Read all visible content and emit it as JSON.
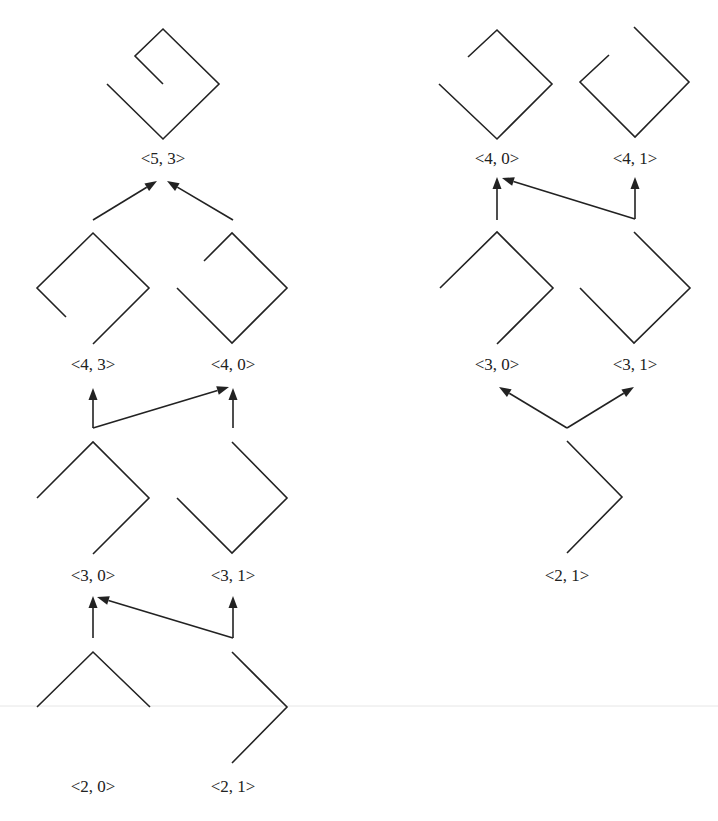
{
  "colors": {
    "stroke": "#222222",
    "background": "#ffffff"
  },
  "left_tree": {
    "nodes": [
      {
        "id": "L53",
        "label": "<5, 3>",
        "label_xy": [
          163,
          164
        ],
        "points": [
          [
            107,
            84
          ],
          [
            163,
            139
          ],
          [
            219,
            84
          ],
          [
            163,
            29
          ],
          [
            135,
            56
          ],
          [
            163,
            84
          ]
        ]
      },
      {
        "id": "L43",
        "label": "<4, 3>",
        "label_xy": [
          93,
          370
        ],
        "points": [
          [
            93,
            344
          ],
          [
            149,
            288
          ],
          [
            93,
            233
          ],
          [
            37,
            288
          ],
          [
            66,
            317
          ]
        ]
      },
      {
        "id": "L40",
        "label": "<4, 0>",
        "label_xy": [
          233,
          370
        ],
        "points": [
          [
            204,
            261
          ],
          [
            232,
            233
          ],
          [
            287,
            288
          ],
          [
            232,
            343
          ],
          [
            177,
            288
          ]
        ]
      },
      {
        "id": "L30",
        "label": "<3, 0>",
        "label_xy": [
          93,
          581
        ],
        "points": [
          [
            37,
            498
          ],
          [
            93,
            442
          ],
          [
            149,
            498
          ],
          [
            93,
            554
          ]
        ]
      },
      {
        "id": "L31",
        "label": "<3, 1>",
        "label_xy": [
          233,
          581
        ],
        "points": [
          [
            232,
            442
          ],
          [
            287,
            498
          ],
          [
            232,
            553
          ],
          [
            177,
            498
          ]
        ]
      },
      {
        "id": "L20",
        "label": "<2, 0>",
        "label_xy": [
          93,
          792
        ],
        "points": [
          [
            37,
            707
          ],
          [
            93,
            652
          ],
          [
            150,
            707
          ]
        ]
      },
      {
        "id": "L21",
        "label": "<2, 1>",
        "label_xy": [
          233,
          792
        ],
        "points": [
          [
            232,
            652
          ],
          [
            287,
            707
          ],
          [
            232,
            763
          ]
        ]
      }
    ],
    "edges": [
      {
        "from": "L43",
        "to": "L53",
        "points": [
          [
            93,
            220
          ],
          [
            157,
            181
          ]
        ]
      },
      {
        "from": "L40",
        "to": "L53",
        "points": [
          [
            233,
            220
          ],
          [
            167,
            181
          ]
        ]
      },
      {
        "from": "L30",
        "to": "L43",
        "points": [
          [
            93,
            428
          ],
          [
            93,
            388
          ]
        ]
      },
      {
        "from": "L30",
        "to": "L40",
        "points": [
          [
            93,
            428
          ],
          [
            229,
            387
          ]
        ]
      },
      {
        "from": "L31",
        "to": "L40",
        "points": [
          [
            233,
            428
          ],
          [
            233,
            388
          ]
        ]
      },
      {
        "from": "L20",
        "to": "L30",
        "points": [
          [
            93,
            638
          ],
          [
            93,
            596
          ]
        ]
      },
      {
        "from": "L21",
        "to": "L30",
        "points": [
          [
            233,
            638
          ],
          [
            97,
            597
          ]
        ]
      },
      {
        "from": "L21",
        "to": "L31",
        "points": [
          [
            233,
            638
          ],
          [
            233,
            596
          ]
        ]
      }
    ]
  },
  "right_tree": {
    "nodes": [
      {
        "id": "R40",
        "label": "<4, 0>",
        "label_xy": [
          497,
          164
        ],
        "points": [
          [
            468,
            57
          ],
          [
            497,
            30
          ],
          [
            552,
            84
          ],
          [
            497,
            139
          ],
          [
            439,
            84
          ]
        ]
      },
      {
        "id": "R41",
        "label": "<4, 1>",
        "label_xy": [
          635,
          164
        ],
        "points": [
          [
            609,
            55
          ],
          [
            580,
            82
          ],
          [
            635,
            137
          ],
          [
            689,
            82
          ],
          [
            634,
            27
          ]
        ]
      },
      {
        "id": "R30",
        "label": "<3, 0>",
        "label_xy": [
          497,
          370
        ],
        "points": [
          [
            440,
            288
          ],
          [
            497,
            232
          ],
          [
            553,
            288
          ],
          [
            497,
            344
          ]
        ]
      },
      {
        "id": "R31",
        "label": "<3, 1>",
        "label_xy": [
          635,
          370
        ],
        "points": [
          [
            634,
            232
          ],
          [
            690,
            288
          ],
          [
            634,
            343
          ],
          [
            580,
            288
          ]
        ]
      },
      {
        "id": "R21",
        "label": "<2, 1>",
        "label_xy": [
          567,
          581
        ],
        "points": [
          [
            567,
            441
          ],
          [
            622,
            497
          ],
          [
            567,
            553
          ]
        ]
      }
    ],
    "edges": [
      {
        "from": "R30",
        "to": "R40",
        "points": [
          [
            497,
            220
          ],
          [
            497,
            177
          ]
        ]
      },
      {
        "from": "R31",
        "to": "R40",
        "points": [
          [
            635,
            219
          ],
          [
            502,
            178
          ]
        ]
      },
      {
        "from": "R31",
        "to": "R41",
        "points": [
          [
            635,
            219
          ],
          [
            635,
            177
          ]
        ]
      },
      {
        "from": "R21",
        "to": "R30",
        "points": [
          [
            567,
            428
          ],
          [
            499,
            387
          ]
        ]
      },
      {
        "from": "R21",
        "to": "R31",
        "points": [
          [
            567,
            428
          ],
          [
            634,
            387
          ]
        ]
      }
    ]
  }
}
